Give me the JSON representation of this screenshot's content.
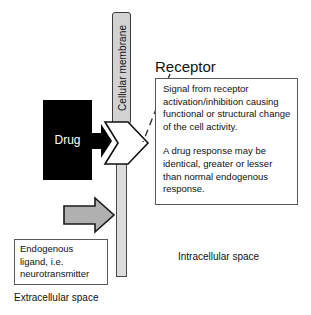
{
  "diagram": {
    "membrane": {
      "label": "Cellular membrane",
      "fill_color": "#d2d2d2",
      "stroke_color": "#3a3a3a"
    },
    "drug": {
      "label": "Drug",
      "fill_color": "#000000",
      "text_color": "#ffffff",
      "arrow_icon": "black-right-arrow-icon"
    },
    "receptor": {
      "title": "Receptor",
      "shape_icon": "receptor-chevron-icon",
      "fill_color": "#ffffff",
      "stroke_color": "#111111",
      "leader_icon": "dashed-leader-line-icon"
    },
    "info_box": {
      "paragraphs": [
        "Signal from receptor activation/inhibition causing functional or structural change of the cell activity.",
        "A drug response may be identical, greater or lesser than normal endogenous response."
      ],
      "border_color": "#5a5a5a"
    },
    "ligand": {
      "text": "Endogenous ligand, i.e. neurotransmitter",
      "arrow_icon": "gray-right-arrow-icon",
      "arrow_fill_color": "#b0b0b0",
      "arrow_stroke_color": "#1a1a1a",
      "border_color": "#5a5a5a"
    },
    "spaces": {
      "extracellular": "Extracellular space",
      "intracellular": "Intracellular space"
    }
  }
}
